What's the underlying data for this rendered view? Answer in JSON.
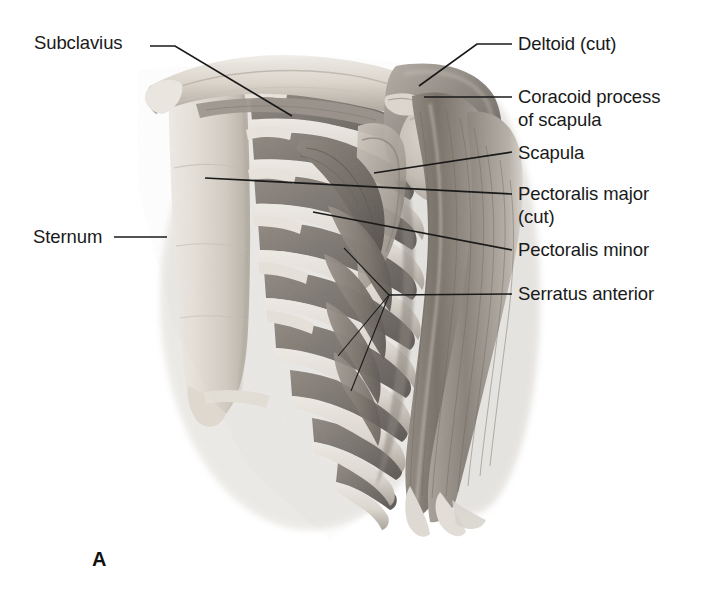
{
  "figure": {
    "letter": "A",
    "background_color": "#ffffff",
    "text_color": "#1a1a1a",
    "style": "grayscale pencil anatomical illustration"
  },
  "labels": [
    {
      "id": "subclavius",
      "text": "Subclavius",
      "side": "left",
      "text_x": 34,
      "text_y": 32,
      "leader": "M 150 46 L 175 46 L 292 116"
    },
    {
      "id": "sternum",
      "text": "Sternum",
      "side": "left",
      "text_x": 33,
      "text_y": 226,
      "leader": "M 114 237 L 167 237"
    },
    {
      "id": "deltoid-cut",
      "text": "Deltoid (cut)",
      "side": "right",
      "text_x": 518,
      "text_y": 33,
      "leader": "M 512 44 L 477 44 L 419 86"
    },
    {
      "id": "coracoid-process",
      "text": "Coracoid process\nof scapula",
      "side": "right",
      "text_x": 518,
      "text_y": 86,
      "leader": "M 512 97 L 424 97"
    },
    {
      "id": "scapula",
      "text": "Scapula",
      "side": "right",
      "text_x": 518,
      "text_y": 142,
      "leader": "M 512 152 L 374 173"
    },
    {
      "id": "pectoralis-major-cut",
      "text": "Pectoralis major\n(cut)",
      "side": "right",
      "text_x": 518,
      "text_y": 183,
      "leader": "M 512 194 L 205 178"
    },
    {
      "id": "pectoralis-minor",
      "text": "Pectoralis minor",
      "side": "right",
      "text_x": 518,
      "text_y": 239,
      "leader": "M 512 250 L 313 212"
    },
    {
      "id": "serratus-anterior",
      "text": "Serratus anterior",
      "side": "right",
      "text_x": 518,
      "text_y": 283,
      "leader": "M 512 294 L 389 295",
      "branches": [
        "M 389 295 L 344 248",
        "M 389 295 L 338 356",
        "M 389 295 L 351 391"
      ]
    }
  ],
  "palette": {
    "leader_line": "#1a1a1a",
    "bone_light": "#ece8e2",
    "bone_mid": "#d5cfc6",
    "bone_shadow": "#b3aca2",
    "muscle_light": "#b9b3ab",
    "muscle_mid": "#8f8880",
    "muscle_dark": "#6d6761",
    "muscle_deep": "#4e4a46",
    "cartilage": "#e3ded6"
  }
}
